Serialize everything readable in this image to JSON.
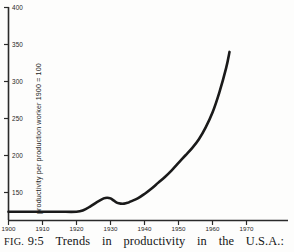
{
  "figure": {
    "caption_label": "FIG.",
    "caption_number": "9:5",
    "caption_words": [
      "Trends",
      "in",
      "productivity",
      "in",
      "the",
      "U.S.A.:"
    ],
    "caption_full": "FIG. 9:5 Trends in productivity in the U.S.A.:"
  },
  "chart_data": {
    "type": "line",
    "title": "",
    "subtitle": "",
    "xlabel": "",
    "ylabel": "productivity per production worker 1900 = 100",
    "xlim": [
      1900,
      1970
    ],
    "ylim": [
      100,
      400
    ],
    "xticks": [
      1900,
      1910,
      1920,
      1930,
      1940,
      1950,
      1960,
      1970
    ],
    "xticklabels": [
      "1900",
      "1910",
      "1920",
      "1930",
      "1940",
      "1950",
      "1960",
      "1970"
    ],
    "yticks": [
      150,
      200,
      250,
      300,
      350,
      400
    ],
    "yticklabels": [
      "150",
      "200",
      "250",
      "300",
      "350",
      "400"
    ],
    "grid": false,
    "legend": null,
    "legend_position": "none",
    "series": [
      {
        "name": "productivity per production worker",
        "color": "#1a1a1a",
        "x": [
          1900,
          1905,
          1910,
          1915,
          1920,
          1922,
          1924,
          1926,
          1928,
          1929,
          1930,
          1931,
          1932,
          1933,
          1934,
          1935,
          1936,
          1938,
          1940,
          1942,
          1944,
          1946,
          1948,
          1950,
          1952,
          1954,
          1956,
          1958,
          1960,
          1962,
          1964,
          1965
        ],
        "y": [
          124,
          124,
          124,
          124,
          124,
          126,
          131,
          137,
          142,
          143,
          142,
          139,
          136,
          135,
          135,
          136,
          138,
          142,
          148,
          155,
          163,
          171,
          180,
          190,
          200,
          210,
          222,
          238,
          258,
          285,
          318,
          340
        ]
      }
    ]
  },
  "axes": {
    "x_axis_name": "year-axis",
    "y_axis_name": "productivity-index-axis"
  }
}
